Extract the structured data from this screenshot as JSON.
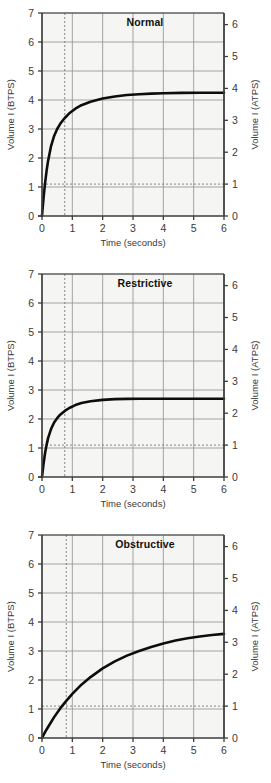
{
  "figure": {
    "panel_count": 3,
    "background_color": "#ffffff",
    "plot_fill": "#f5f5f3",
    "grid_color": "#9a9a9a",
    "axis_color": "#3d3d3d",
    "curve_color": "#0d0d0d",
    "dashed_color": "#7a7a7a"
  },
  "charts": [
    {
      "type": "line",
      "title": "Normal",
      "xlabel": "Time (seconds)",
      "ylabel": "Volume I (BTPS)",
      "ylabel_right": "Volume I (ATPS)",
      "xlim": [
        0,
        6
      ],
      "ylim": [
        0,
        7
      ],
      "ylim_right": [
        0,
        6
      ],
      "xticks": [
        0,
        1,
        2,
        3,
        4,
        5,
        6
      ],
      "xticklabels": [
        "0",
        "1",
        "2",
        "3",
        "4",
        "5",
        "6"
      ],
      "yticks": [
        0,
        1,
        2,
        3,
        4,
        5,
        6,
        7
      ],
      "yticklabels": [
        "0",
        "1",
        "2",
        "3",
        "4",
        "5",
        "6",
        "7"
      ],
      "yticks_right": [
        0,
        1,
        2,
        3,
        4,
        5,
        6
      ],
      "yticklabels_right": [
        "0",
        "1",
        "2",
        "3",
        "4",
        "5",
        "6"
      ],
      "grid": true,
      "legend": "none",
      "annotations": {
        "vline_x": 0.75,
        "hline_y": 1.1
      },
      "plateau": 4.25,
      "x": [
        0,
        0.05,
        0.1,
        0.15,
        0.2,
        0.3,
        0.4,
        0.5,
        0.6,
        0.75,
        0.9,
        1.1,
        1.3,
        1.6,
        2.0,
        2.4,
        2.8,
        3.2,
        3.6,
        4.0,
        4.6,
        5.2,
        6.0
      ],
      "y": [
        0,
        0.62,
        1.12,
        1.55,
        1.9,
        2.42,
        2.76,
        3.0,
        3.18,
        3.38,
        3.54,
        3.7,
        3.82,
        3.94,
        4.05,
        4.12,
        4.17,
        4.2,
        4.22,
        4.235,
        4.245,
        4.25,
        4.25
      ]
    },
    {
      "type": "line",
      "title": "Restrictive",
      "xlabel": "Time (seconds)",
      "ylabel": "Volume I (BTPS)",
      "ylabel_right": "Volume I (ATPS)",
      "xlim": [
        0,
        6
      ],
      "ylim": [
        0,
        7
      ],
      "ylim_right": [
        0,
        6
      ],
      "xticks": [
        0,
        1,
        2,
        3,
        4,
        5,
        6
      ],
      "xticklabels": [
        "0",
        "1",
        "2",
        "3",
        "4",
        "5",
        "6"
      ],
      "yticks": [
        0,
        1,
        2,
        3,
        4,
        5,
        6,
        7
      ],
      "yticklabels": [
        "0",
        "1",
        "2",
        "3",
        "4",
        "5",
        "6",
        "7"
      ],
      "yticks_right": [
        0,
        1,
        2,
        3,
        4,
        5,
        6
      ],
      "yticklabels_right": [
        "0",
        "1",
        "2",
        "3",
        "4",
        "5",
        "6"
      ],
      "grid": true,
      "legend": "none",
      "annotations": {
        "vline_x": 0.75,
        "hline_y": 1.1
      },
      "plateau": 2.7,
      "x": [
        0,
        0.05,
        0.1,
        0.15,
        0.2,
        0.3,
        0.4,
        0.5,
        0.6,
        0.75,
        0.9,
        1.1,
        1.3,
        1.6,
        2.0,
        2.4,
        2.8,
        3.2,
        3.6,
        4.0,
        4.6,
        5.2,
        6.0
      ],
      "y": [
        0,
        0.45,
        0.82,
        1.1,
        1.34,
        1.66,
        1.88,
        2.03,
        2.15,
        2.28,
        2.38,
        2.48,
        2.55,
        2.61,
        2.66,
        2.685,
        2.695,
        2.7,
        2.7,
        2.7,
        2.7,
        2.7,
        2.7
      ]
    },
    {
      "type": "line",
      "title": "Obstructive",
      "xlabel": "Time (seconds)",
      "ylabel": "Volume I (BTPS)",
      "ylabel_right": "Volume I (ATPS)",
      "xlim": [
        0,
        6
      ],
      "ylim": [
        0,
        7
      ],
      "ylim_right": [
        0,
        6
      ],
      "xticks": [
        0,
        1,
        2,
        3,
        4,
        5,
        6
      ],
      "xticklabels": [
        "0",
        "1",
        "2",
        "3",
        "4",
        "5",
        "6"
      ],
      "yticks": [
        0,
        1,
        2,
        3,
        4,
        5,
        6,
        7
      ],
      "yticklabels": [
        "0",
        "1",
        "2",
        "3",
        "4",
        "5",
        "6",
        "7"
      ],
      "yticks_right": [
        0,
        1,
        2,
        3,
        4,
        5,
        6
      ],
      "yticklabels_right": [
        "0",
        "1",
        "2",
        "3",
        "4",
        "5",
        "6"
      ],
      "grid": true,
      "legend": "none",
      "annotations": {
        "vline_x": 0.8,
        "hline_y": 1.1
      },
      "plateau": 3.6,
      "x": [
        0,
        0.1,
        0.2,
        0.4,
        0.6,
        0.8,
        1.0,
        1.3,
        1.6,
        2.0,
        2.4,
        2.8,
        3.2,
        3.6,
        4.0,
        4.4,
        4.8,
        5.2,
        5.6,
        6.0
      ],
      "y": [
        0,
        0.2,
        0.38,
        0.72,
        1.02,
        1.28,
        1.52,
        1.84,
        2.1,
        2.4,
        2.64,
        2.84,
        3.0,
        3.14,
        3.26,
        3.36,
        3.44,
        3.5,
        3.55,
        3.59
      ]
    }
  ],
  "chart_data": {
    "type": "line",
    "xlabel": "Time (seconds)",
    "ylabel": "Volume I (BTPS)",
    "ylabel_secondary": "Volume I (ATPS)",
    "xlim": [
      0,
      6
    ],
    "ylim": [
      0,
      7
    ],
    "ylim_secondary": [
      0,
      6
    ],
    "grid": true,
    "legend": "none",
    "panels": [
      "Normal",
      "Restrictive",
      "Obstructive"
    ],
    "x": [
      0,
      0.5,
      1.0,
      1.5,
      2.0,
      2.5,
      3.0,
      3.5,
      4.0,
      4.5,
      5.0,
      5.5,
      6.0
    ],
    "series": [
      {
        "name": "Normal",
        "values": [
          0,
          3.0,
          3.62,
          3.9,
          4.05,
          4.14,
          4.19,
          4.215,
          4.235,
          4.243,
          4.248,
          4.25,
          4.25
        ],
        "plateau": 4.25
      },
      {
        "name": "Restrictive",
        "values": [
          0,
          2.03,
          2.43,
          2.59,
          2.66,
          2.69,
          2.7,
          2.7,
          2.7,
          2.7,
          2.7,
          2.7,
          2.7
        ],
        "plateau": 2.7
      },
      {
        "name": "Obstructive",
        "values": [
          0,
          0.9,
          1.52,
          1.98,
          2.4,
          2.72,
          2.94,
          3.12,
          3.26,
          3.38,
          3.47,
          3.54,
          3.59
        ],
        "plateau": 3.6
      }
    ],
    "annotations": [
      {
        "kind": "vline",
        "x": 0.75,
        "style": "dotted",
        "note": "0.75 second mark"
      },
      {
        "kind": "hline",
        "y": 1.1,
        "style": "dotted",
        "note": "1 L (ATPS) level"
      }
    ]
  }
}
